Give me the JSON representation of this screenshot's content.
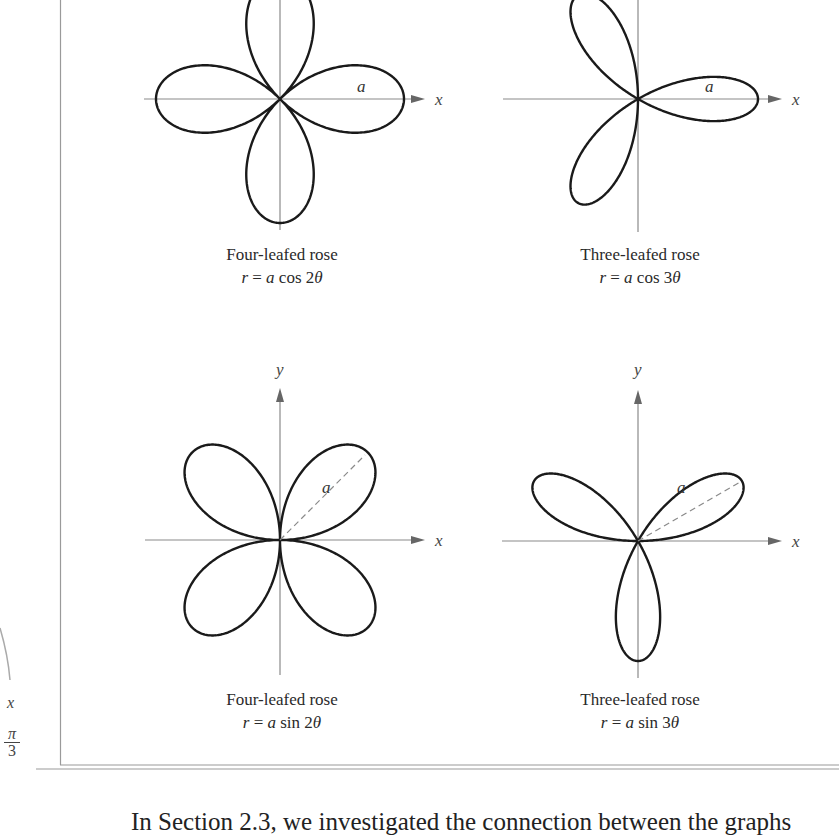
{
  "figure": {
    "panels": [
      {
        "id": "four-leaf-cos",
        "name": "Four-leafed rose",
        "equation": {
          "lhs": "r",
          "eq": "=",
          "coef": "a",
          "fn": "cos",
          "mult": "2",
          "var": "θ"
        },
        "petal_label": "a",
        "axis_labels": {
          "x": "x",
          "y": ""
        },
        "petals": 4,
        "n": 2,
        "trig": "cos",
        "show_dashed_radius": false
      },
      {
        "id": "three-leaf-cos",
        "name": "Three-leafed rose",
        "equation": {
          "lhs": "r",
          "eq": "=",
          "coef": "a",
          "fn": "cos",
          "mult": "3",
          "var": "θ"
        },
        "petal_label": "a",
        "axis_labels": {
          "x": "x",
          "y": ""
        },
        "petals": 3,
        "n": 3,
        "trig": "cos",
        "show_dashed_radius": false
      },
      {
        "id": "four-leaf-sin",
        "name": "Four-leafed rose",
        "equation": {
          "lhs": "r",
          "eq": "=",
          "coef": "a",
          "fn": "sin",
          "mult": "2",
          "var": "θ"
        },
        "petal_label": "a",
        "axis_labels": {
          "x": "x",
          "y": "y"
        },
        "petals": 4,
        "n": 2,
        "trig": "sin",
        "show_dashed_radius": true
      },
      {
        "id": "three-leaf-sin",
        "name": "Three-leafed rose",
        "equation": {
          "lhs": "r",
          "eq": "=",
          "coef": "a",
          "fn": "sin",
          "mult": "3",
          "var": "θ"
        },
        "petal_label": "a",
        "axis_labels": {
          "x": "x",
          "y": "y"
        },
        "petals": 3,
        "n": 3,
        "trig": "sin",
        "show_dashed_radius": true
      }
    ]
  },
  "margin": {
    "x_label": "x",
    "fraction": {
      "numerator": "π",
      "denominator": "3"
    }
  },
  "body_text": "In Section 2.3, we investigated the connection between the graphs",
  "colors": {
    "curve": "#1a1a1a",
    "axis": "#8a8a8a",
    "frame": "#9a9a9a",
    "dashed": "#8a8a8a"
  }
}
